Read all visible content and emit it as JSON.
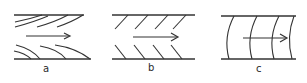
{
  "figure": {
    "panels": [
      {
        "id": "a",
        "label": "a",
        "pattern": "curved-oblique-strokes",
        "arrow": "right-arrow"
      },
      {
        "id": "b",
        "label": "b",
        "pattern": "chevron-strokes",
        "arrow": "right-arrow"
      },
      {
        "id": "c",
        "label": "c",
        "pattern": "curved-vertical-arcs",
        "arrow": "right-arrow"
      }
    ],
    "colors": {
      "line": "#333333",
      "background": "#ffffff"
    }
  }
}
